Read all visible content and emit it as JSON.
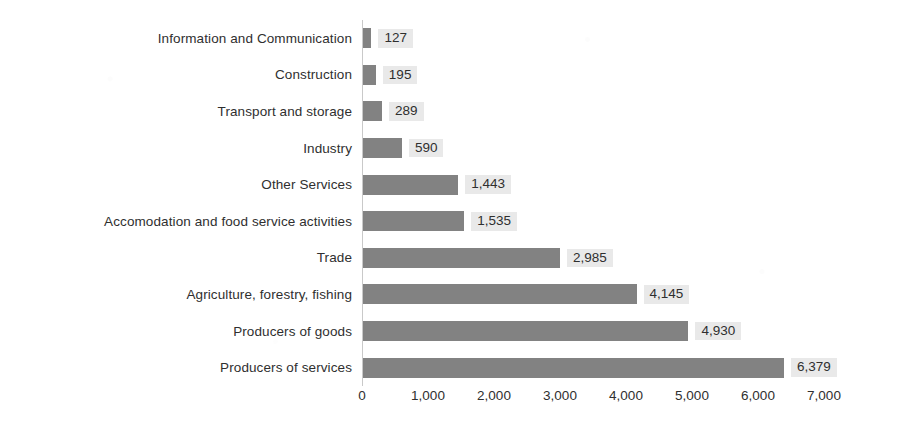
{
  "chart_data": {
    "type": "bar",
    "orientation": "horizontal",
    "title": "",
    "subtitle": "",
    "xlabel": "",
    "ylabel": "",
    "grid": false,
    "legend": false,
    "xlim": [
      0,
      7000
    ],
    "xticks": [
      "0",
      "1,000",
      "2,000",
      "3,000",
      "4,000",
      "5,000",
      "6,000",
      "7,000"
    ],
    "xtick_values": [
      0,
      1000,
      2000,
      3000,
      4000,
      5000,
      6000,
      7000
    ],
    "categories": [
      "Information and Communication",
      "Construction",
      "Transport and storage",
      "Industry",
      "Other Services",
      "Accomodation and food service activities",
      "Trade",
      "Agriculture, forestry, fishing",
      "Producers of goods",
      "Producers of services"
    ],
    "values": [
      127,
      195,
      289,
      590,
      1443,
      1535,
      2985,
      4145,
      4930,
      6379
    ],
    "value_labels": [
      "127",
      "195",
      "289",
      "590",
      "1,443",
      "1,535",
      "2,985",
      "4,145",
      "4,930",
      "6,379"
    ],
    "bar_color": "#828282",
    "value_label_bg": "#e9e9e9",
    "axis_color": "#c9c9c9",
    "text_color": "#2f2f2f",
    "background": "#ffffff"
  }
}
